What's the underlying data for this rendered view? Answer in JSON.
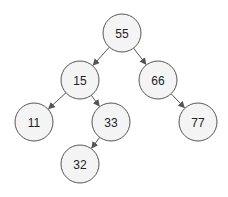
{
  "diagram": {
    "type": "binary-search-tree",
    "node_radius": 19,
    "colors": {
      "node_fill": "#f4f4f4",
      "node_stroke": "#555555",
      "edge": "#555555",
      "text": "#222222",
      "background": "#ffffff"
    },
    "nodes": [
      {
        "id": "n55",
        "label": "55",
        "x": 122,
        "y": 33
      },
      {
        "id": "n15",
        "label": "15",
        "x": 80,
        "y": 80
      },
      {
        "id": "n66",
        "label": "66",
        "x": 158,
        "y": 80
      },
      {
        "id": "n11",
        "label": "11",
        "x": 34,
        "y": 122
      },
      {
        "id": "n33",
        "label": "33",
        "x": 111,
        "y": 122
      },
      {
        "id": "n77",
        "label": "77",
        "x": 198,
        "y": 122
      },
      {
        "id": "n32",
        "label": "32",
        "x": 80,
        "y": 164
      }
    ],
    "edges": [
      {
        "from": "n55",
        "to": "n15"
      },
      {
        "from": "n55",
        "to": "n66"
      },
      {
        "from": "n15",
        "to": "n11"
      },
      {
        "from": "n15",
        "to": "n33"
      },
      {
        "from": "n66",
        "to": "n77"
      },
      {
        "from": "n33",
        "to": "n32"
      }
    ]
  }
}
